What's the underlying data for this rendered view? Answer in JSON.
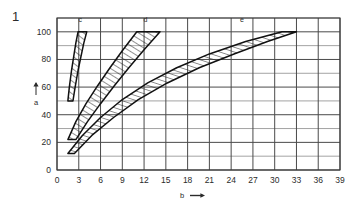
{
  "figure": {
    "number": "1"
  },
  "axes": {
    "x": {
      "label": "b",
      "arrow": "→",
      "min": 0,
      "max": 39,
      "tick_step": 3,
      "ticks": [
        "0",
        "3",
        "6",
        "9",
        "12",
        "15",
        "18",
        "21",
        "24",
        "27",
        "30",
        "33",
        "36",
        "39"
      ]
    },
    "y": {
      "label": "a",
      "arrow": "↑",
      "min": 0,
      "max": 110,
      "tick_step": 20,
      "ticks": [
        "0",
        "20",
        "40",
        "60",
        "80",
        "100"
      ],
      "minor_step": 10
    }
  },
  "style": {
    "grid_color": "#4a4a4a",
    "minor_grid_color": "#8c8c8c",
    "frame_color": "#3a3a3a",
    "curve_color": "#111111",
    "hatch_color": "#222222",
    "background": "#ffffff"
  },
  "chart_data": {
    "type": "line",
    "title": "",
    "xlabel": "b",
    "ylabel": "a",
    "xlim": [
      0,
      39
    ],
    "ylim": [
      0,
      110
    ],
    "grid": true,
    "legend": "inline-band-labels",
    "series": [
      {
        "name": "c",
        "label": "c",
        "label_position": {
          "b": 3.2,
          "a": 107
        },
        "upper": {
          "comment": "left/upper boundary of band c",
          "x": [
            1.5,
            1.7,
            2.0,
            2.3,
            2.6,
            2.9
          ],
          "y": [
            50,
            60,
            72,
            82,
            92,
            100
          ]
        },
        "lower": {
          "comment": "right/lower boundary of band c",
          "x": [
            2.2,
            2.5,
            2.9,
            3.3,
            3.7,
            4.1
          ],
          "y": [
            50,
            60,
            72,
            82,
            92,
            100
          ]
        }
      },
      {
        "name": "d",
        "label": "d",
        "label_position": {
          "b": 12.2,
          "a": 107
        },
        "upper": {
          "comment": "left/upper boundary of band d",
          "x": [
            1.5,
            2.6,
            4.0,
            5.6,
            7.3,
            9.1,
            11.0
          ],
          "y": [
            22,
            35,
            48,
            61,
            74,
            87,
            100
          ]
        },
        "lower": {
          "comment": "right/lower boundary of band d",
          "x": [
            2.6,
            4.2,
            6.0,
            7.9,
            9.9,
            12.0,
            14.2
          ],
          "y": [
            22,
            35,
            48,
            61,
            74,
            87,
            100
          ]
        }
      },
      {
        "name": "e",
        "label": "e",
        "label_position": {
          "b": 25.5,
          "a": 107
        },
        "upper": {
          "comment": "upper/left boundary of band e",
          "x": [
            1.5,
            3.5,
            6.0,
            9.0,
            12.5,
            16.5,
            21.0,
            26.0,
            31.0
          ],
          "y": [
            12,
            25,
            38,
            51,
            63,
            74,
            84,
            93,
            100
          ]
        },
        "lower": {
          "comment": "lower/right boundary of band e",
          "x": [
            2.4,
            4.8,
            7.8,
            11.2,
            15.2,
            19.6,
            24.4,
            29.0,
            33.0
          ],
          "y": [
            12,
            25,
            38,
            51,
            63,
            74,
            84,
            93,
            100
          ]
        }
      }
    ]
  }
}
